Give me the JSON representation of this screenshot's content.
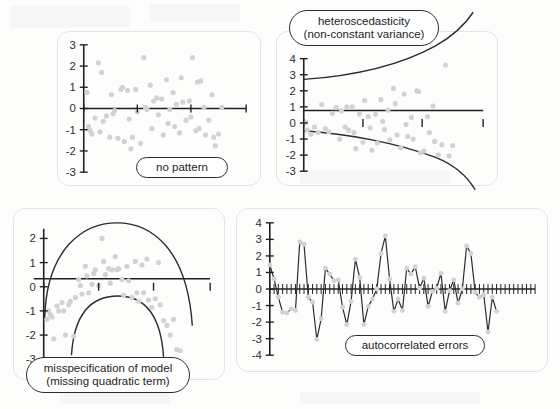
{
  "figure": {
    "background_color": "#fdfdfc",
    "panel_border_color": "#e4e4e6",
    "axis_color": "#1f1f1f",
    "point_color": "#d2d2d2",
    "curve_color": "#2b2b2b",
    "label_text_color": "#1d1d1d"
  },
  "panels": [
    {
      "id": "no-pattern",
      "label_lines": [
        "no pattern"
      ],
      "chart_data": {
        "type": "scatter",
        "title": "no pattern",
        "xlabel": "",
        "ylabel": "",
        "ylim": [
          -3,
          3
        ],
        "xlim": [
          0,
          100
        ],
        "yticks": [
          3,
          2,
          1,
          0,
          -1,
          -2,
          -3
        ],
        "ytick_labels": [
          "3",
          "2",
          "1",
          "0",
          "-1",
          "-2",
          "-3"
        ],
        "xticks": [
          0,
          33,
          66,
          100
        ],
        "xtick_labels": [
          "",
          "",
          "",
          ""
        ],
        "grid": false,
        "legend": "none",
        "points": [
          [
            2,
            0.75
          ],
          [
            3,
            -0.85
          ],
          [
            4,
            -1.05
          ],
          [
            5,
            -1.2
          ],
          [
            7,
            -0.45
          ],
          [
            9,
            2.15
          ],
          [
            10,
            -1.1
          ],
          [
            11,
            1.7
          ],
          [
            12,
            -0.6
          ],
          [
            14,
            -0.35
          ],
          [
            16,
            -1.35
          ],
          [
            17,
            0.65
          ],
          [
            18,
            -0.25
          ],
          [
            19,
            -0.1
          ],
          [
            21,
            -1.4
          ],
          [
            23,
            0.9
          ],
          [
            24,
            1.0
          ],
          [
            25,
            -1.55
          ],
          [
            27,
            0.85
          ],
          [
            28,
            -0.5
          ],
          [
            29,
            -1.9
          ],
          [
            30,
            -1.35
          ],
          [
            32,
            0.9
          ],
          [
            33,
            -0.15
          ],
          [
            35,
            -1.65
          ],
          [
            37,
            2.4
          ],
          [
            38,
            0.05
          ],
          [
            39,
            -0.05
          ],
          [
            41,
            1.1
          ],
          [
            42,
            -0.95
          ],
          [
            43,
            0.35
          ],
          [
            45,
            0.5
          ],
          [
            46,
            -0.3
          ],
          [
            48,
            0.45
          ],
          [
            49,
            -1.25
          ],
          [
            51,
            1.35
          ],
          [
            52,
            -0.7
          ],
          [
            53,
            -0.05
          ],
          [
            55,
            0.75
          ],
          [
            56,
            -0.85
          ],
          [
            57,
            0.2
          ],
          [
            59,
            -1.15
          ],
          [
            60,
            1.45
          ],
          [
            61,
            0.3
          ],
          [
            63,
            -0.55
          ],
          [
            65,
            0.35
          ],
          [
            66,
            -0.4
          ],
          [
            67,
            2.4
          ],
          [
            69,
            -1.05
          ],
          [
            70,
            1.25
          ],
          [
            71,
            -0.95
          ],
          [
            72,
            1.3
          ],
          [
            74,
            0.05
          ],
          [
            75,
            -1.25
          ],
          [
            77,
            -0.55
          ],
          [
            79,
            0.65
          ],
          [
            80,
            -1.35
          ],
          [
            81,
            -1.75
          ],
          [
            83,
            -1.2
          ],
          [
            85,
            0.05
          ]
        ],
        "reference_line": {
          "y": 0,
          "style": "solid"
        }
      }
    },
    {
      "id": "heteroscedasticity",
      "label_lines": [
        "heteroscedasticity",
        "(non-constant variance)"
      ],
      "chart_data": {
        "type": "scatter",
        "title": "heteroscedasticity (non-constant variance)",
        "xlabel": "",
        "ylabel": "",
        "ylim": [
          -3,
          4
        ],
        "xlim": [
          0,
          100
        ],
        "yticks": [
          4,
          3,
          2,
          1,
          0,
          -1,
          -2,
          -3
        ],
        "ytick_labels": [
          "4",
          "3",
          "2",
          "1",
          "0",
          "-1",
          "-2",
          "-3"
        ],
        "xticks": [
          0,
          33,
          66,
          100
        ],
        "xtick_labels": [
          "",
          "",
          "",
          ""
        ],
        "grid": false,
        "legend": "none",
        "points": [
          [
            1,
            0.05
          ],
          [
            2,
            -0.45
          ],
          [
            4,
            -0.7
          ],
          [
            6,
            -0.25
          ],
          [
            8,
            -0.6
          ],
          [
            10,
            1.15
          ],
          [
            12,
            -0.35
          ],
          [
            14,
            -0.55
          ],
          [
            16,
            0.6
          ],
          [
            18,
            0.95
          ],
          [
            20,
            -1.0
          ],
          [
            21,
            0.75
          ],
          [
            23,
            -0.25
          ],
          [
            24,
            1.0
          ],
          [
            25,
            -0.45
          ],
          [
            27,
            1.0
          ],
          [
            28,
            -0.6
          ],
          [
            29,
            -1.6
          ],
          [
            31,
            0.55
          ],
          [
            33,
            -1.2
          ],
          [
            34,
            1.4
          ],
          [
            36,
            0.4
          ],
          [
            37,
            -0.3
          ],
          [
            38,
            -1.7
          ],
          [
            40,
            0.55
          ],
          [
            41,
            -1.25
          ],
          [
            43,
            1.45
          ],
          [
            44,
            0.1
          ],
          [
            45,
            -0.4
          ],
          [
            47,
            0.8
          ],
          [
            48,
            -1.05
          ],
          [
            50,
            2.15
          ],
          [
            51,
            1.2
          ],
          [
            52,
            -0.75
          ],
          [
            54,
            -1.55
          ],
          [
            56,
            1.8
          ],
          [
            57,
            -0.1
          ],
          [
            58,
            -0.85
          ],
          [
            60,
            0.35
          ],
          [
            61,
            -1.0
          ],
          [
            63,
            2.0
          ],
          [
            64,
            1.95
          ],
          [
            65,
            -1.85
          ],
          [
            67,
            -1.75
          ],
          [
            69,
            0.4
          ],
          [
            70,
            -0.6
          ],
          [
            72,
            1.05
          ],
          [
            73,
            -1.15
          ],
          [
            75,
            -2.0
          ],
          [
            77,
            -1.35
          ],
          [
            79,
            3.6
          ],
          [
            81,
            -2.05
          ],
          [
            83,
            -1.4
          ]
        ],
        "reference_line": {
          "y": 0,
          "style": "solid"
        },
        "envelope_curves": [
          {
            "name": "upper-funnel",
            "description": "expanding upper bound from y=2.35 to above y=4"
          },
          {
            "name": "lower-funnel",
            "description": "expanding lower bound from y=-1.75 to below y=-3"
          }
        ]
      }
    },
    {
      "id": "misspecification",
      "label_lines": [
        "misspecification of model",
        "(missing quadratic term)"
      ],
      "chart_data": {
        "type": "scatter",
        "title": "misspecification of model (missing quadratic term)",
        "xlabel": "",
        "ylabel": "",
        "ylim": [
          -3,
          2.4
        ],
        "xlim": [
          0,
          100
        ],
        "yticks": [
          2,
          1,
          0,
          -1,
          -2,
          -3
        ],
        "ytick_labels": [
          "2",
          "1",
          "0",
          "-1",
          "-2",
          "-3"
        ],
        "xticks": [
          0,
          33,
          66,
          100
        ],
        "xtick_labels": [
          "",
          "",
          "",
          ""
        ],
        "grid": false,
        "legend": "none",
        "points": [
          [
            2,
            -1.35
          ],
          [
            3,
            -1.0
          ],
          [
            4,
            -1.15
          ],
          [
            5,
            -1.25
          ],
          [
            6,
            -2.15
          ],
          [
            8,
            -0.8
          ],
          [
            9,
            -1.0
          ],
          [
            11,
            -0.65
          ],
          [
            12,
            -1.0
          ],
          [
            13,
            -2.0
          ],
          [
            15,
            -0.75
          ],
          [
            16,
            -0.6
          ],
          [
            18,
            -2.05
          ],
          [
            19,
            -0.45
          ],
          [
            21,
            0.3
          ],
          [
            22,
            0.05
          ],
          [
            23,
            -0.3
          ],
          [
            25,
            0.85
          ],
          [
            26,
            0.45
          ],
          [
            27,
            -0.25
          ],
          [
            29,
            0.1
          ],
          [
            30,
            0.55
          ],
          [
            31,
            0.7
          ],
          [
            33,
            0.05
          ],
          [
            35,
            2.0
          ],
          [
            36,
            1.05
          ],
          [
            37,
            0.5
          ],
          [
            39,
            0.75
          ],
          [
            40,
            0.15
          ],
          [
            41,
            0.7
          ],
          [
            43,
            1.25
          ],
          [
            44,
            0.7
          ],
          [
            45,
            0.75
          ],
          [
            47,
            0.3
          ],
          [
            48,
            -0.35
          ],
          [
            50,
            0.85
          ],
          [
            51,
            0.25
          ],
          [
            53,
            -0.45
          ],
          [
            55,
            1.05
          ],
          [
            56,
            -0.25
          ],
          [
            57,
            -0.6
          ],
          [
            59,
            0.9
          ],
          [
            60,
            -0.25
          ],
          [
            62,
            1.15
          ],
          [
            63,
            -0.55
          ],
          [
            65,
            -0.85
          ],
          [
            67,
            -0.5
          ],
          [
            69,
            1.0
          ],
          [
            70,
            -0.75
          ],
          [
            72,
            -1.4
          ],
          [
            74,
            -1.6
          ],
          [
            76,
            -2.0
          ],
          [
            78,
            -1.35
          ],
          [
            80,
            -2.6
          ],
          [
            82,
            -2.65
          ]
        ],
        "reference_line": {
          "y": 0,
          "style": "solid"
        },
        "envelope_curves": [
          {
            "name": "outer-arc",
            "description": "inverted-U arc peaking near y=2.3"
          },
          {
            "name": "inner-arc",
            "description": "inverted-U arc peaking near y=-0.6"
          }
        ]
      }
    },
    {
      "id": "autocorrelated-errors",
      "label_lines": [
        "autocorrelated errors"
      ],
      "chart_data": {
        "type": "line",
        "title": "autocorrelated errors",
        "xlabel": "",
        "ylabel": "",
        "ylim": [
          -4,
          4
        ],
        "xlim": [
          0,
          64
        ],
        "yticks": [
          4,
          3,
          2,
          1,
          0,
          -1,
          -2,
          -3,
          -4
        ],
        "ytick_labels": [
          "4",
          "3",
          "2",
          "1",
          "0",
          "-1",
          "-2",
          "-3",
          "-4"
        ],
        "grid": false,
        "legend": "none",
        "markers": true,
        "reference_line": {
          "y": 0,
          "style": "solid-with-ticks"
        },
        "x": [
          0,
          1,
          2,
          3,
          4,
          5,
          6,
          7,
          8,
          9,
          10,
          11,
          12,
          13,
          14,
          15,
          16,
          17,
          18,
          19,
          20,
          21,
          22,
          23,
          24,
          25,
          26,
          27,
          28,
          29,
          30,
          31,
          32,
          33,
          34,
          35,
          36,
          37,
          38,
          39,
          40,
          41,
          42,
          43,
          44,
          45,
          46,
          47,
          48,
          49,
          50,
          51,
          52,
          53,
          54,
          55,
          56,
          57,
          58,
          59,
          60,
          61,
          62
        ],
        "values": [
          1.45,
          0.6,
          -0.5,
          -1.4,
          -1.45,
          -1.2,
          -1.3,
          2.85,
          2.7,
          -0.5,
          -0.8,
          -3.05,
          -1.8,
          1.25,
          0.9,
          0.5,
          0.55,
          -1.1,
          -2.15,
          -0.75,
          1.8,
          0.7,
          -2.15,
          -1.05,
          -0.6,
          0.0,
          2.15,
          3.2,
          0.6,
          -1.35,
          -0.6,
          -1.3,
          1.25,
          0.9,
          1.35,
          0.05,
          0.65,
          -1.05,
          -0.15,
          0.05,
          0.95,
          -1.35,
          -0.1,
          0.55,
          -0.85,
          0.0,
          2.6,
          2.15,
          -0.2,
          -0.5,
          -0.35,
          -2.6,
          -0.5,
          -1.35
        ]
      }
    }
  ]
}
